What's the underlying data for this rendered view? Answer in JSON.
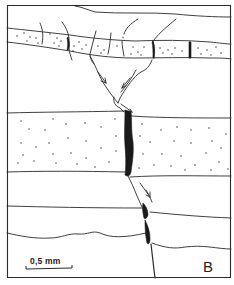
{
  "figure": {
    "type": "geological thin-section sketch",
    "panel_label": "B",
    "scale_bar": {
      "label": "0,5 mm"
    },
    "colors": {
      "line": "#2a2a2a",
      "fill_fracture": "#1a1a1a",
      "background": "#ffffff"
    },
    "elements": [
      "upper thin sandy bed, segmented by vertical cracks",
      "funnel-shaped branching fracture with arrows (downward)",
      "thick dotted sandy bed cut by dark filled vein",
      "lower laminae with wavy boundary offset across fracture",
      "fracture continuing to base of frame"
    ]
  }
}
